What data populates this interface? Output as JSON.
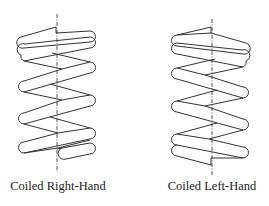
{
  "figure": {
    "springs": [
      {
        "id": "right-hand",
        "label": "Coiled Right-Hand",
        "handedness": "right",
        "centerline_x": 57
      },
      {
        "id": "left-hand",
        "label": "Coiled Left-Hand",
        "handedness": "left",
        "centerline_x": 212
      }
    ],
    "colors": {
      "stroke": "#333333",
      "centerline": "#555555",
      "background": "#ffffff",
      "text": "#222222"
    }
  }
}
